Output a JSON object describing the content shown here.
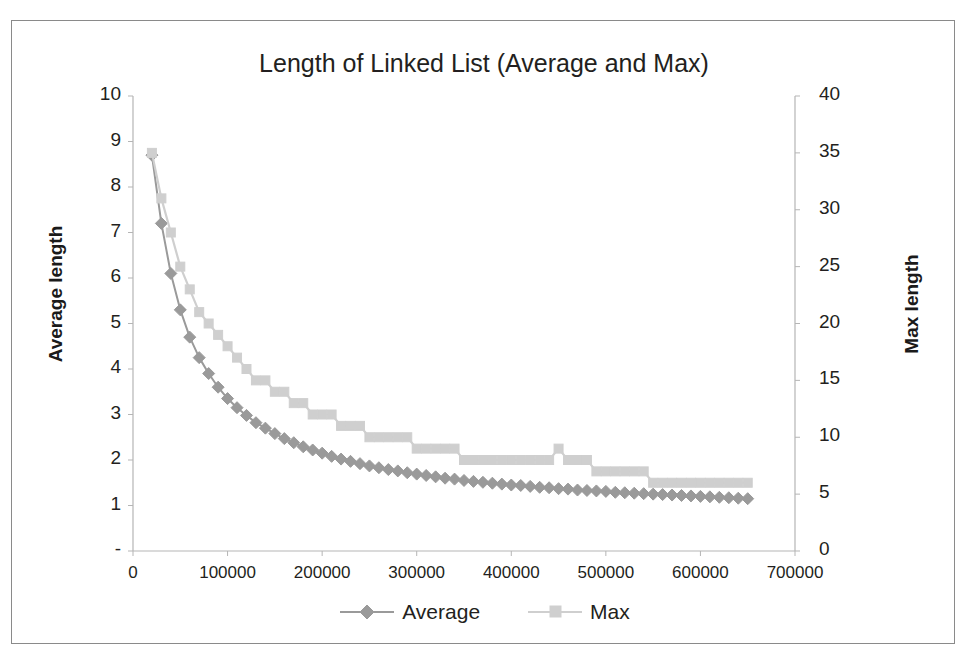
{
  "chart_data": {
    "type": "line",
    "title": "Length of Linked List (Average and Max)",
    "xlabel": "",
    "ylabel": "Average length",
    "y2label": "Max length",
    "xlim": [
      0,
      700000
    ],
    "ylim": [
      0,
      10
    ],
    "y2lim": [
      0,
      40
    ],
    "xticks": [
      "0",
      "100000",
      "200000",
      "300000",
      "400000",
      "500000",
      "600000",
      "700000"
    ],
    "xtick_values": [
      0,
      100000,
      200000,
      300000,
      400000,
      500000,
      600000,
      700000
    ],
    "yticks_left": [
      "10",
      "9",
      "8",
      "7",
      "6",
      "5",
      "4",
      "3",
      "2",
      "1",
      "-"
    ],
    "ytick_left_values": [
      10,
      9,
      8,
      7,
      6,
      5,
      4,
      3,
      2,
      1,
      0
    ],
    "yticks_right": [
      "40",
      "35",
      "30",
      "25",
      "20",
      "15",
      "10",
      "5",
      "0"
    ],
    "ytick_right_values": [
      40,
      35,
      30,
      25,
      20,
      15,
      10,
      5,
      0
    ],
    "grid": false,
    "legend_position": "bottom",
    "markers": {
      "average": "diamond",
      "max": "square"
    },
    "colors": {
      "average": "#9a9a9a",
      "max": "#cfcfcf",
      "axis": "#b5b5b5",
      "text": "#231f20"
    },
    "x": [
      20000,
      30000,
      40000,
      50000,
      60000,
      70000,
      80000,
      90000,
      100000,
      110000,
      120000,
      130000,
      140000,
      150000,
      160000,
      170000,
      180000,
      190000,
      200000,
      210000,
      220000,
      230000,
      240000,
      250000,
      260000,
      270000,
      280000,
      290000,
      300000,
      310000,
      320000,
      330000,
      340000,
      350000,
      360000,
      370000,
      380000,
      390000,
      400000,
      410000,
      420000,
      430000,
      440000,
      450000,
      460000,
      470000,
      480000,
      490000,
      500000,
      510000,
      520000,
      530000,
      540000,
      550000,
      560000,
      570000,
      580000,
      590000,
      600000,
      610000,
      620000,
      630000,
      640000,
      650000
    ],
    "series": [
      {
        "name": "Average",
        "axis": "left",
        "values": [
          8.7,
          7.2,
          6.1,
          5.3,
          4.7,
          4.25,
          3.9,
          3.6,
          3.35,
          3.15,
          2.98,
          2.82,
          2.7,
          2.58,
          2.47,
          2.38,
          2.29,
          2.22,
          2.15,
          2.08,
          2.02,
          1.97,
          1.92,
          1.87,
          1.83,
          1.79,
          1.76,
          1.72,
          1.69,
          1.66,
          1.63,
          1.6,
          1.58,
          1.55,
          1.53,
          1.51,
          1.49,
          1.47,
          1.45,
          1.44,
          1.42,
          1.4,
          1.39,
          1.37,
          1.36,
          1.34,
          1.33,
          1.32,
          1.31,
          1.29,
          1.28,
          1.27,
          1.26,
          1.25,
          1.24,
          1.23,
          1.22,
          1.21,
          1.2,
          1.19,
          1.18,
          1.17,
          1.16,
          1.15
        ]
      },
      {
        "name": "Max",
        "axis": "right",
        "values": [
          35.0,
          31.0,
          28.0,
          25.0,
          23.0,
          21.0,
          20.0,
          19.0,
          18.0,
          17.0,
          16.0,
          15.0,
          15.0,
          14.0,
          14.0,
          13.0,
          13.0,
          12.0,
          12.0,
          12.0,
          11.0,
          11.0,
          11.0,
          10.0,
          10.0,
          10.0,
          10.0,
          10.0,
          9.0,
          9.0,
          9.0,
          9.0,
          9.0,
          8.0,
          8.0,
          8.0,
          8.0,
          8.0,
          8.0,
          8.0,
          8.0,
          8.0,
          8.0,
          9.0,
          8.0,
          8.0,
          8.0,
          7.0,
          7.0,
          7.0,
          7.0,
          7.0,
          7.0,
          6.0,
          6.0,
          6.0,
          6.0,
          6.0,
          6.0,
          6.0,
          6.0,
          6.0,
          6.0,
          6.0
        ]
      }
    ]
  },
  "legend": {
    "items": [
      {
        "label": "Average",
        "marker": "diamond",
        "color": "#9a9a9a"
      },
      {
        "label": "Max",
        "marker": "square",
        "color": "#cfcfcf"
      }
    ]
  }
}
